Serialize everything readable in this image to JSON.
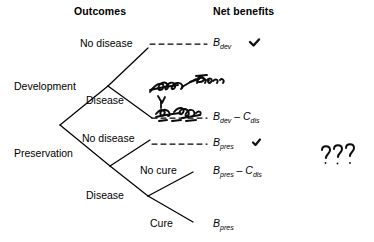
{
  "figure": {
    "type": "decision-tree",
    "headers": {
      "outcomes": "Outcomes",
      "net_benefits": "Net benefits"
    },
    "ink_color": "#000000",
    "background_color": "#ffffff"
  },
  "branches": {
    "development": "Development",
    "preservation": "Preservation"
  },
  "nodes": {
    "dev_no_disease": "No disease",
    "dev_disease": "Disease",
    "pres_no_disease": "No disease",
    "pres_disease": "Disease",
    "pres_no_cure": "No cure",
    "pres_cure": "Cure"
  },
  "payoffs": {
    "dev_no_disease": {
      "base": "B",
      "sub": "dev",
      "op": "",
      "base2": "",
      "sub2": ""
    },
    "dev_disease": {
      "base": "B",
      "sub": "dev",
      "op": " – ",
      "base2": "C",
      "sub2": "dis"
    },
    "pres_no_disease": {
      "base": "B",
      "sub": "pres",
      "op": "",
      "base2": "",
      "sub2": ""
    },
    "pres_no_cure": {
      "base": "B",
      "sub": "pres",
      "op": " – ",
      "base2": "C",
      "sub2": "dis"
    },
    "pres_cure": {
      "base": "B",
      "sub": "pres",
      "op": "",
      "base2": "",
      "sub2": ""
    }
  },
  "payoff_text": {
    "dev_no_disease": "B_dev",
    "dev_disease": "B_dev – C_dis",
    "pres_no_disease": "B_pres",
    "pres_no_cure": "B_pres – C_dis",
    "pres_cure": "B_pres"
  },
  "annotations": {
    "check_top": "✓",
    "check_middle": "✓",
    "question_marks": "???",
    "scribble_upper": "illegible-handwriting",
    "scribble_lower": "illegible-handwriting",
    "scribble_caret": "caret-insertion-mark"
  }
}
